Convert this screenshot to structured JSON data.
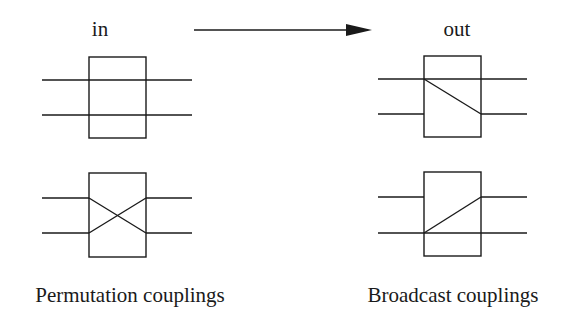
{
  "diagram": {
    "header": {
      "input_label": "in",
      "output_label": "out"
    },
    "arrow": {
      "direction": "right",
      "from": "in",
      "to": "out"
    },
    "permutation": {
      "caption": "Permutation couplings",
      "couplings": [
        {
          "type": "identity",
          "description": "two straight wires passing through box"
        },
        {
          "type": "swap",
          "description": "two wires crossing inside box"
        }
      ]
    },
    "broadcast": {
      "caption": "Broadcast couplings",
      "couplings": [
        {
          "type": "broadcast-top-to-bottom",
          "description": "top wire passes through and branches diagonally to bottom output"
        },
        {
          "type": "broadcast-bottom-to-top",
          "description": "bottom wire passes through and branches diagonally to top output"
        }
      ]
    },
    "colors": {
      "stroke": "#1a1a1a",
      "background": "#ffffff"
    }
  }
}
